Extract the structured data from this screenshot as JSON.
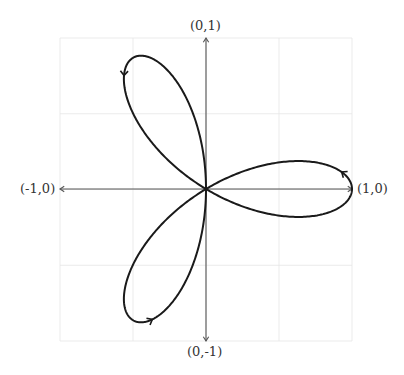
{
  "diagram": {
    "title": "",
    "curve": "rose r = cos(3θ)",
    "labels": {
      "top": "(0,1)",
      "bottom": "(0,-1)",
      "left": "(-1,0)",
      "right": "(1,0)"
    },
    "colors": {
      "curve": "#1a1a1a",
      "axis": "#555555",
      "grid": "#e6e6e6"
    },
    "grid": {
      "divisions": 4,
      "range": [
        -1,
        1
      ]
    },
    "direction_arrows": 3
  }
}
